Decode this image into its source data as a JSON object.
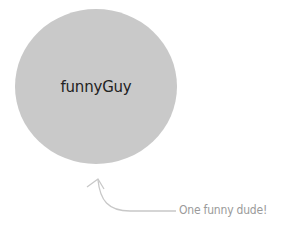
{
  "object": {
    "label": "funnyGuy",
    "fill_color": "#c9c9c9"
  },
  "annotation": {
    "text": "One funny dude!",
    "color": "#9a9a9a"
  }
}
